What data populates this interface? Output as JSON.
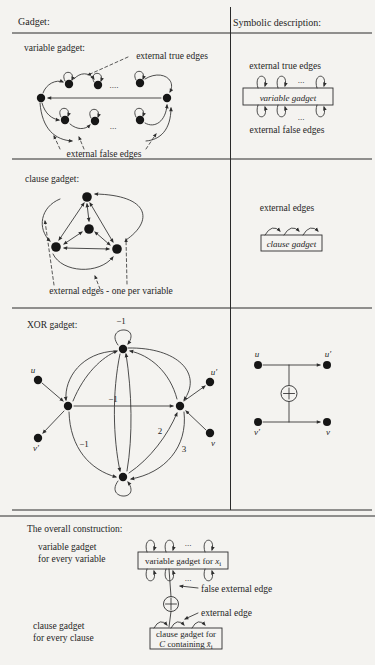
{
  "header": {
    "left": "Gadget:",
    "right": "Symbolic description:"
  },
  "variable": {
    "label": "variable gadget:",
    "true_edges": "external true edges",
    "false_edges": "external false edges",
    "dots_top": "....",
    "dots_bottom": "...",
    "symbolic": {
      "true_edges": "external true edges",
      "box": "variable gadget",
      "false_edges": "external false edges",
      "dots_top": "...",
      "dots_bottom": "..."
    }
  },
  "clause": {
    "label": "clause gadget:",
    "annotation": "external edges - one per variable",
    "symbolic": {
      "label": "external edges",
      "box": "clause gadget"
    }
  },
  "xor": {
    "label": "XOR gadget:",
    "w_loop": "−1",
    "w_mid": "−1",
    "w_left": "−1",
    "w_two": "2",
    "w_three": "3",
    "u": "u",
    "u_prime": "u′",
    "v": "v",
    "v_prime": "v′",
    "symbolic": {
      "u": "u",
      "u_prime": "u′",
      "v": "v",
      "v_prime": "v′",
      "xor_icon": "circle-plus"
    }
  },
  "overall": {
    "title": "The overall construction:",
    "var_caption_line1": "variable gadget",
    "var_caption_line2": "for every variable",
    "clause_caption_line1": "clause gadget",
    "clause_caption_line2": "for every clause",
    "var_box_pre": "variable gadget for ",
    "var_box_var": "x",
    "var_box_sub": "i",
    "false_edge": "false external edge",
    "edge": "external edge",
    "clause_box_line1": "clause gadget for",
    "clause_box_c": "C",
    "clause_box_mid": " containing ",
    "clause_box_var": "x̄",
    "clause_box_sub": "i",
    "dots_top": "...",
    "dots_bottom": "...",
    "xor_icon": "circle-plus"
  }
}
